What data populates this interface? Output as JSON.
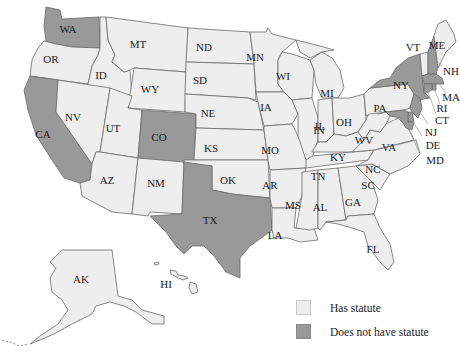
{
  "colors": {
    "has_statute": "#eeeeee",
    "no_statute": "#999999",
    "border": "#6a6a6a",
    "background": "#ffffff"
  },
  "legend": {
    "items": [
      {
        "label": "Has statute",
        "category": "has_statute"
      },
      {
        "label": "Does not have statute",
        "category": "no_statute"
      }
    ]
  },
  "states": {
    "WA": {
      "label": "WA",
      "category": "no_statute"
    },
    "OR": {
      "label": "OR",
      "category": "has_statute"
    },
    "CA": {
      "label": "CA",
      "category": "no_statute"
    },
    "ID": {
      "label": "ID",
      "category": "has_statute"
    },
    "NV": {
      "label": "NV",
      "category": "has_statute"
    },
    "MT": {
      "label": "MT",
      "category": "has_statute"
    },
    "WY": {
      "label": "WY",
      "category": "has_statute"
    },
    "UT": {
      "label": "UT",
      "category": "has_statute"
    },
    "AZ": {
      "label": "AZ",
      "category": "has_statute"
    },
    "CO": {
      "label": "CO",
      "category": "no_statute"
    },
    "NM": {
      "label": "NM",
      "category": "has_statute"
    },
    "ND": {
      "label": "ND",
      "category": "has_statute"
    },
    "SD": {
      "label": "SD",
      "category": "has_statute"
    },
    "NE": {
      "label": "NE",
      "category": "has_statute"
    },
    "KS": {
      "label": "KS",
      "category": "has_statute"
    },
    "OK": {
      "label": "OK",
      "category": "has_statute"
    },
    "TX": {
      "label": "TX",
      "category": "no_statute"
    },
    "MN": {
      "label": "MN",
      "category": "has_statute"
    },
    "IA": {
      "label": "IA",
      "category": "has_statute"
    },
    "MO": {
      "label": "MO",
      "category": "has_statute"
    },
    "AR": {
      "label": "AR",
      "category": "has_statute"
    },
    "LA": {
      "label": "LA",
      "category": "has_statute"
    },
    "WI": {
      "label": "WI",
      "category": "has_statute"
    },
    "IL": {
      "label": "IL",
      "category": "has_statute"
    },
    "MI": {
      "label": "MI",
      "category": "has_statute"
    },
    "IN": {
      "label": "IN",
      "category": "has_statute"
    },
    "OH": {
      "label": "OH",
      "category": "has_statute"
    },
    "KY": {
      "label": "KY",
      "category": "has_statute"
    },
    "TN": {
      "label": "TN",
      "category": "has_statute"
    },
    "MS": {
      "label": "MS",
      "category": "has_statute"
    },
    "AL": {
      "label": "AL",
      "category": "has_statute"
    },
    "GA": {
      "label": "GA",
      "category": "has_statute"
    },
    "FL": {
      "label": "FL",
      "category": "has_statute"
    },
    "SC": {
      "label": "SC",
      "category": "has_statute"
    },
    "NC": {
      "label": "NC",
      "category": "has_statute"
    },
    "VA": {
      "label": "VA",
      "category": "has_statute"
    },
    "WV": {
      "label": "WV",
      "category": "has_statute"
    },
    "PA": {
      "label": "PA",
      "category": "has_statute"
    },
    "NY": {
      "label": "NY",
      "category": "no_statute"
    },
    "VT": {
      "label": "VT",
      "category": "has_statute"
    },
    "NH": {
      "label": "NH",
      "category": "no_statute"
    },
    "ME": {
      "label": "ME",
      "category": "has_statute"
    },
    "MA": {
      "label": "MA",
      "category": "no_statute"
    },
    "RI": {
      "label": "RI",
      "category": "no_statute"
    },
    "CT": {
      "label": "CT",
      "category": "no_statute"
    },
    "NJ": {
      "label": "NJ",
      "category": "no_statute"
    },
    "DE": {
      "label": "DE",
      "category": "no_statute"
    },
    "MD": {
      "label": "MD",
      "category": "no_statute"
    },
    "AK": {
      "label": "AK",
      "category": "has_statute"
    },
    "HI": {
      "label": "HI",
      "category": "has_statute"
    }
  }
}
